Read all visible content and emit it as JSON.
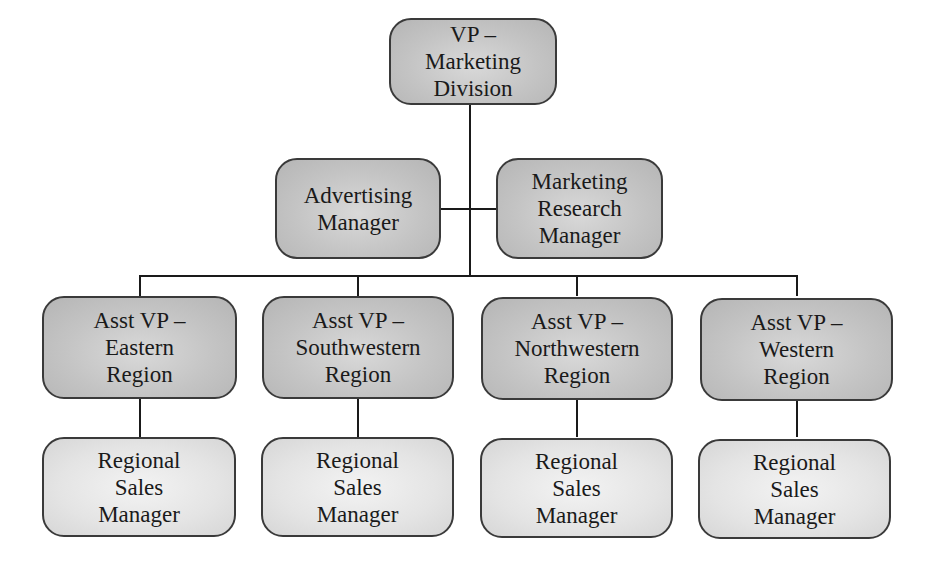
{
  "chart": {
    "type": "org-chart",
    "colors": {
      "upper_box": "#c8c8c8",
      "lower_box": "#e6e6e6",
      "line": "#1a1a1a",
      "border": "#3a3a3a"
    },
    "root": {
      "lines": [
        "VP –",
        "Marketing",
        "Division"
      ]
    },
    "staff": [
      {
        "lines": [
          "Advertising",
          "Manager"
        ]
      },
      {
        "lines": [
          "Marketing",
          "Research",
          "Manager"
        ]
      }
    ],
    "regions": [
      {
        "vp": {
          "lines": [
            "Asst VP –",
            "Eastern",
            "Region"
          ]
        },
        "manager": {
          "lines": [
            "Regional",
            "Sales",
            "Manager"
          ]
        }
      },
      {
        "vp": {
          "lines": [
            "Asst VP –",
            "Southwestern",
            "Region"
          ]
        },
        "manager": {
          "lines": [
            "Regional",
            "Sales",
            "Manager"
          ]
        }
      },
      {
        "vp": {
          "lines": [
            "Asst VP –",
            "Northwestern",
            "Region"
          ]
        },
        "manager": {
          "lines": [
            "Regional",
            "Sales",
            "Manager"
          ]
        }
      },
      {
        "vp": {
          "lines": [
            "Asst VP –",
            "Western",
            "Region"
          ]
        },
        "manager": {
          "lines": [
            "Regional",
            "Sales",
            "Manager"
          ]
        }
      }
    ]
  }
}
